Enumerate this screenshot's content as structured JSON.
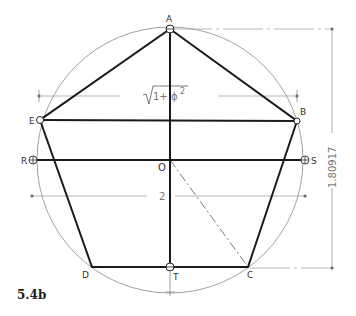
{
  "figure": {
    "label": "5.4b"
  },
  "points": {
    "A": "A",
    "B": "B",
    "C": "C",
    "D": "D",
    "E": "E",
    "O": "O",
    "R": "R",
    "S": "S",
    "T": "T"
  },
  "dimensions": {
    "diagonal": "√1+ϕ²",
    "diagonal_radicand": "1+ ϕ",
    "diagonal_exponent": "2",
    "width": "2",
    "height": "1.80917"
  },
  "colors": {
    "heavy_line": "#1a1a1a",
    "thin_line": "#888888",
    "dim_text": "#777777"
  }
}
